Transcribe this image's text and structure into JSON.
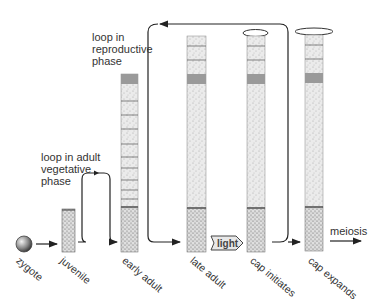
{
  "figure": {
    "annotations": {
      "loop_reproductive": [
        "loop in",
        "reproductive",
        "phase"
      ],
      "loop_vegetative": [
        "loop in adult",
        "vegetative",
        "phase"
      ],
      "light_trigger": "light",
      "meiosis": "meiosis"
    },
    "stages": [
      {
        "id": "zygote",
        "label": "zygote"
      },
      {
        "id": "juvenile",
        "label": "juvenile"
      },
      {
        "id": "early-adult",
        "label": "early adult"
      },
      {
        "id": "late-adult",
        "label": "late adult"
      },
      {
        "id": "cap-initiates",
        "label": "cap initiates"
      },
      {
        "id": "cap-expands",
        "label": "cap expands"
      }
    ],
    "colors": {
      "stalk_fill": "#e6e6e6",
      "rhizoid_fill": "#d4d4d4",
      "whorl_band": "#9a9a9a",
      "line": "#333333"
    }
  }
}
